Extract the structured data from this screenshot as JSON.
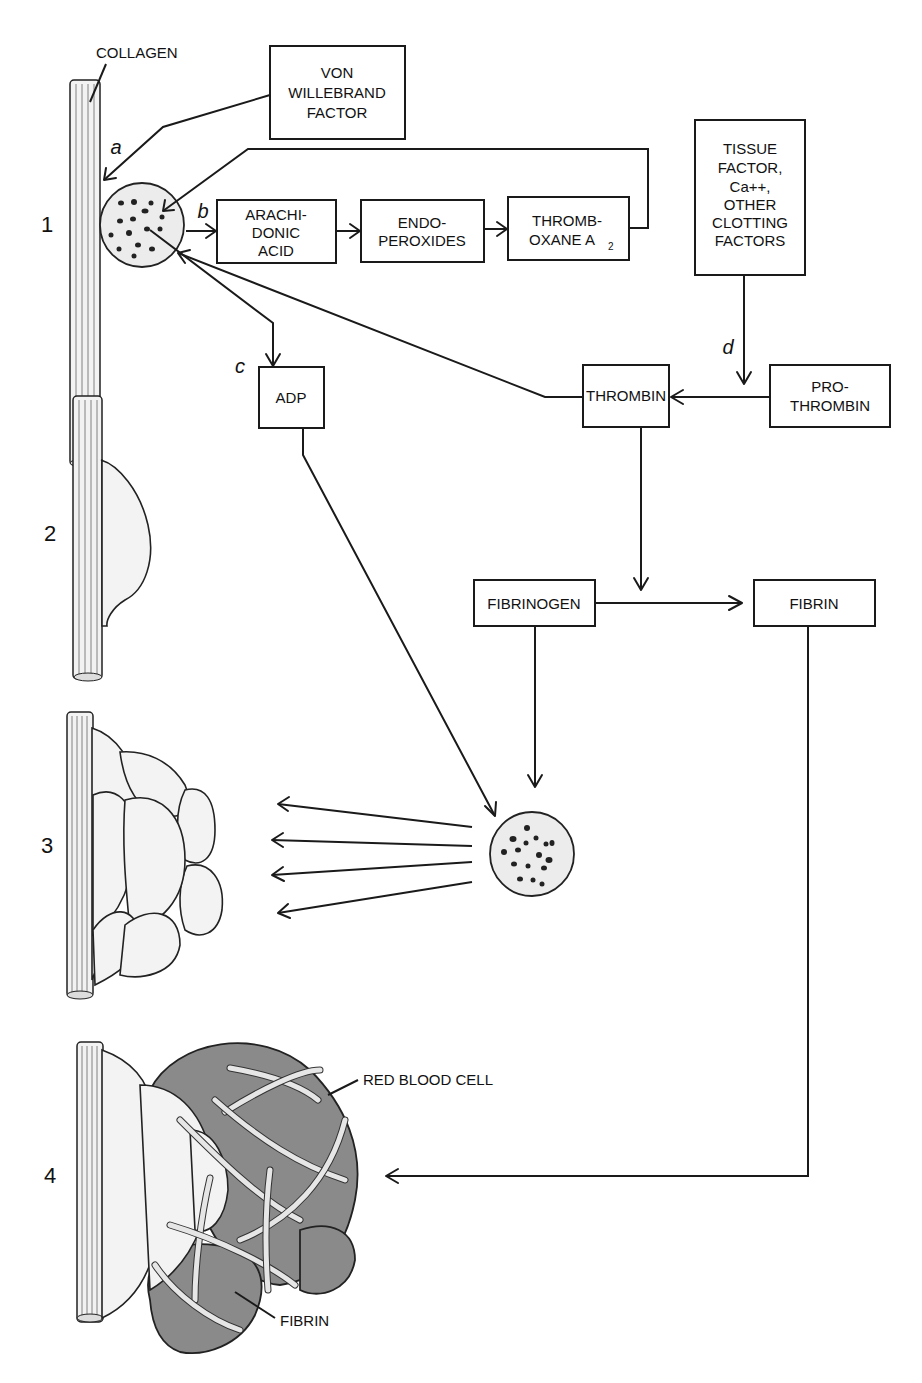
{
  "figure": {
    "stages": [
      {
        "number": "1"
      },
      {
        "number": "2"
      },
      {
        "number": "3"
      },
      {
        "number": "4"
      }
    ],
    "step_letters": {
      "a": "a",
      "b": "b",
      "c": "c",
      "d": "d"
    },
    "callouts": {
      "collagen": "COLLAGEN",
      "red_blood_cell": "RED BLOOD CELL",
      "fibrin_strand": "FIBRIN"
    },
    "boxes": {
      "von_willebrand": {
        "lines": [
          "VON",
          "WILLEBRAND",
          "FACTOR"
        ]
      },
      "arachidonic_acid": {
        "lines": [
          "ARACHI-",
          "DONIC",
          "ACID"
        ]
      },
      "endoperoxides": {
        "lines": [
          "ENDO-",
          "PEROXIDES"
        ]
      },
      "thromboxane": {
        "lines": [
          "THROMB-",
          "OXANE A"
        ],
        "subscript": "2"
      },
      "tissue_factor": {
        "lines": [
          "TISSUE",
          "FACTOR,",
          "Ca++,",
          "OTHER",
          "CLOTTING",
          "FACTORS"
        ]
      },
      "adp": {
        "lines": [
          "ADP"
        ]
      },
      "thrombin": {
        "lines": [
          "THROMBIN"
        ]
      },
      "prothrombin": {
        "lines": [
          "PRO-",
          "THROMBIN"
        ]
      },
      "fibrinogen": {
        "lines": [
          "FIBRINOGEN"
        ]
      },
      "fibrin": {
        "lines": [
          "FIBRIN"
        ]
      }
    },
    "flows": [
      {
        "from": "von_willebrand",
        "to": "platelet_stage1",
        "label": "a"
      },
      {
        "from": "platelet_stage1",
        "to": "arachidonic_acid",
        "label": "b"
      },
      {
        "from": "arachidonic_acid",
        "to": "endoperoxides"
      },
      {
        "from": "endoperoxides",
        "to": "thromboxane"
      },
      {
        "from": "thromboxane",
        "to": "platelet_stage1"
      },
      {
        "from": "platelet_stage1",
        "to": "adp",
        "label": "c"
      },
      {
        "from": "thrombin",
        "to": "platelet_stage1"
      },
      {
        "from": "tissue_factor",
        "to": "thrombin",
        "label": "d"
      },
      {
        "from": "prothrombin",
        "to": "thrombin"
      },
      {
        "from": "thrombin",
        "to": "fibrinogen_to_fibrin"
      },
      {
        "from": "fibrinogen",
        "to": "fibrin"
      },
      {
        "from": "adp",
        "to": "platelet_center"
      },
      {
        "from": "fibrinogen",
        "to": "platelet_center"
      },
      {
        "from": "platelet_center",
        "to": "stage3_aggregate"
      },
      {
        "from": "fibrin",
        "to": "stage4_clot"
      }
    ]
  }
}
